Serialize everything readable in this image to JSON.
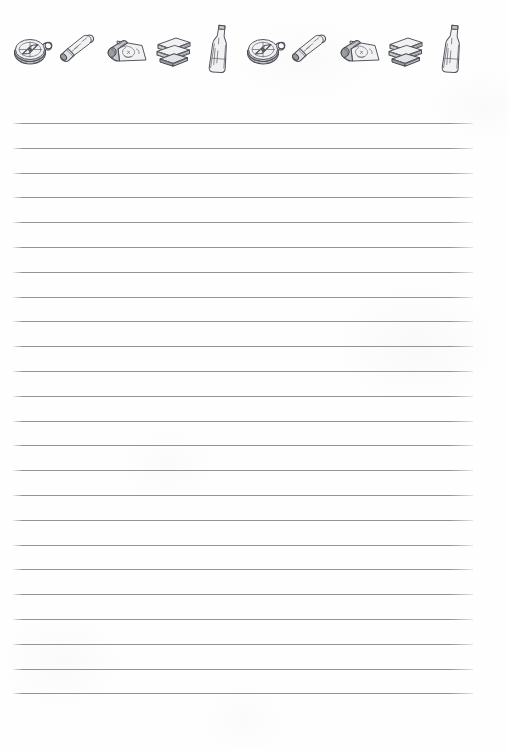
{
  "page": {
    "kind": "printable-lined-notebook-paper",
    "width": 508,
    "height": 751,
    "background_color": "#fefefe",
    "paper_texture": "faint mottled grey speckle"
  },
  "header": {
    "name": "adventure-icon-border",
    "repeat_count": 2,
    "icons_per_repeat": 5,
    "total_icons": 10,
    "ink_color": "#4d4f55",
    "top": 30,
    "bottom": 80,
    "icons": [
      {
        "name": "compass-icon",
        "label": "Compass"
      },
      {
        "name": "spyglass-icon",
        "label": "Spyglass"
      },
      {
        "name": "treasure-map-scroll-icon",
        "label": "Rolled Treasure Map"
      },
      {
        "name": "book-stack-icon",
        "label": "Stack of Books"
      },
      {
        "name": "message-bottle-icon",
        "label": "Glass Bottle"
      },
      {
        "name": "compass-icon",
        "label": "Compass"
      },
      {
        "name": "spyglass-icon",
        "label": "Spyglass"
      },
      {
        "name": "treasure-map-scroll-icon",
        "label": "Rolled Treasure Map"
      },
      {
        "name": "book-stack-icon",
        "label": "Stack of Books"
      },
      {
        "name": "message-bottle-icon",
        "label": "Glass Bottle"
      }
    ]
  },
  "ruled_area": {
    "name": "writing-lines",
    "line_color": "#808289",
    "line_count": 24,
    "first_line_y": 123,
    "line_spacing": 24.8,
    "line_left": 13,
    "line_right": 473,
    "line_width": 460
  }
}
